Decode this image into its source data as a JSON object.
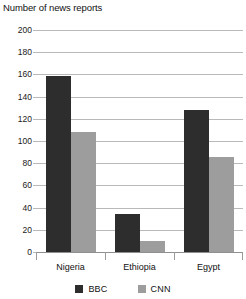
{
  "chart_data": {
    "type": "bar",
    "title": "Number of news reports",
    "xlabel": "",
    "ylabel": "",
    "categories": [
      "Nigeria",
      "Ethiopia",
      "Egypt"
    ],
    "series": [
      {
        "name": "BBC",
        "color": "#2d2d2d",
        "values": [
          159,
          34,
          128
        ]
      },
      {
        "name": "CNN",
        "color": "#9d9d9d",
        "values": [
          108,
          10,
          86
        ]
      }
    ],
    "ylim": [
      0,
      200
    ],
    "ytick_step": 20,
    "yticks": [
      200,
      180,
      160,
      140,
      120,
      100,
      80,
      60,
      40,
      20,
      0
    ],
    "grid": true,
    "legend_position": "bottom",
    "gridline_color": "#b9b9b9",
    "background": "#ffffff"
  },
  "legend": {
    "items": [
      {
        "label": "BBC",
        "color": "#2d2d2d"
      },
      {
        "label": "CNN",
        "color": "#9d9d9d"
      }
    ]
  }
}
